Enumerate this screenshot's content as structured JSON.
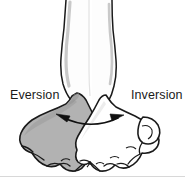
{
  "figure": {
    "background_color": "#ffffff"
  },
  "labels": {
    "left": "Eversion",
    "right": "Inversion"
  },
  "colors": {
    "outline": "#1a1a1a",
    "shaded_foot_fill": "#b2b2b2",
    "shaded_foot_fill_dark": "#9a9a9a",
    "plain_foot_fill": "#ffffff",
    "leg_fill": "#fdfdfd",
    "leg_shadow": "#c9c9c9",
    "text": "#1a1a1a",
    "arrow": "#111111",
    "baseline": "#d8d8d8"
  },
  "arrow": {
    "type": "double-headed-curved",
    "left_head_label": "eversion-direction",
    "right_head_label": "inversion-direction"
  },
  "anatomy": {
    "left_foot": "everted-foot-shaded",
    "right_foot": "inverted-foot-plain",
    "left_leg": "left-lower-leg",
    "right_leg": "right-lower-leg"
  }
}
